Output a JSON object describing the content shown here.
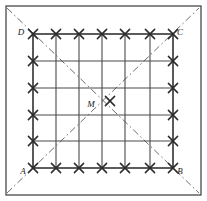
{
  "figure": {
    "background_color": "#ffffff",
    "line_color": "#4a4a4a",
    "border_color": "#3a3a3a",
    "dash_color": "#6e6e6e",
    "mark_color": "#2b2b2b",
    "label_color": "#1a1a1a",
    "outer_frame": {
      "name": "outer-rectangle",
      "x": 6,
      "y": 6,
      "width": 195,
      "height": 189,
      "stroke_width": 1.2
    },
    "inner_square": {
      "name": "square-ABCD",
      "left": 33,
      "top": 34,
      "right": 173,
      "bottom": 168,
      "stroke_width": 1.6
    },
    "grid": {
      "columns": 6,
      "rows": 5,
      "x_lines": [
        33,
        56,
        79,
        102,
        125,
        150,
        173
      ],
      "y_lines": [
        34,
        61,
        88,
        115,
        141,
        168
      ],
      "stroke_width": 1.1
    },
    "vertices": [
      {
        "id": "A",
        "label": "A",
        "x": 33,
        "y": 168,
        "label_x": 23,
        "label_y": 172,
        "corner": "bottom-left"
      },
      {
        "id": "B",
        "label": "B",
        "x": 173,
        "y": 168,
        "label_x": 180,
        "label_y": 172,
        "corner": "bottom-right"
      },
      {
        "id": "C",
        "label": "C",
        "x": 173,
        "y": 34,
        "label_x": 180,
        "label_y": 33,
        "corner": "top-right"
      },
      {
        "id": "D",
        "label": "D",
        "x": 33,
        "y": 34,
        "label_x": 21,
        "label_y": 33,
        "corner": "top-left"
      },
      {
        "id": "M",
        "label": "M",
        "x": 103,
        "y": 101,
        "label_x": 91,
        "label_y": 105,
        "corner": "center"
      }
    ],
    "diagonals": [
      {
        "name": "diagonal-A-C-extended",
        "x1": 7,
        "y1": 193,
        "x2": 199,
        "y2": 8,
        "style": "dash-dot"
      },
      {
        "name": "diagonal-D-B-extended",
        "x1": 7,
        "y1": 8,
        "x2": 199,
        "y2": 193,
        "style": "dash-dot"
      }
    ],
    "x_marks": {
      "size": 4.6,
      "stroke_width": 1.5,
      "points": [
        {
          "x": 33,
          "y": 34
        },
        {
          "x": 56,
          "y": 34
        },
        {
          "x": 79,
          "y": 34
        },
        {
          "x": 102,
          "y": 34
        },
        {
          "x": 125,
          "y": 34
        },
        {
          "x": 150,
          "y": 34
        },
        {
          "x": 173,
          "y": 34
        },
        {
          "x": 33,
          "y": 61
        },
        {
          "x": 173,
          "y": 61
        },
        {
          "x": 33,
          "y": 88
        },
        {
          "x": 173,
          "y": 88
        },
        {
          "x": 33,
          "y": 115
        },
        {
          "x": 173,
          "y": 115
        },
        {
          "x": 33,
          "y": 141
        },
        {
          "x": 173,
          "y": 141
        },
        {
          "x": 33,
          "y": 168
        },
        {
          "x": 56,
          "y": 168
        },
        {
          "x": 79,
          "y": 168
        },
        {
          "x": 102,
          "y": 168
        },
        {
          "x": 125,
          "y": 168
        },
        {
          "x": 150,
          "y": 168
        },
        {
          "x": 173,
          "y": 168
        },
        {
          "x": 110,
          "y": 101
        }
      ]
    }
  }
}
